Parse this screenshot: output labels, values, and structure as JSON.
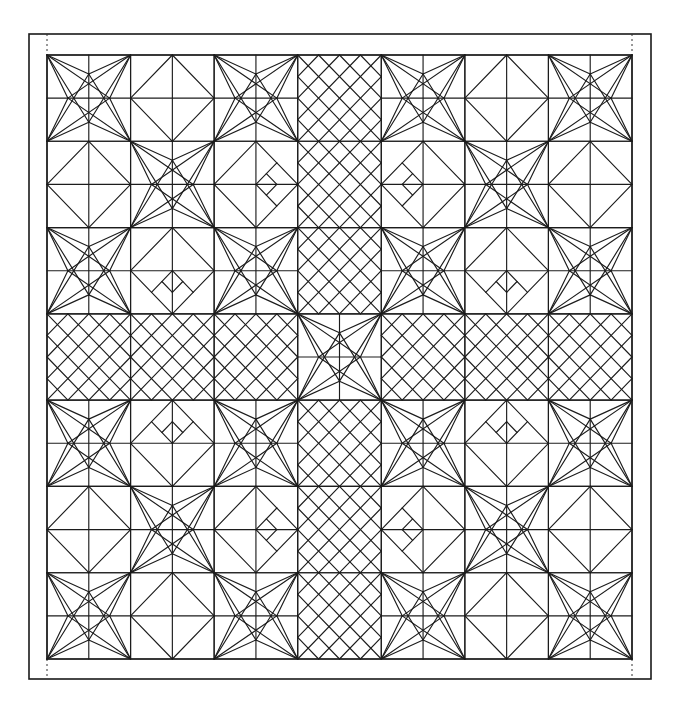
{
  "figure": {
    "title": "",
    "canvas": {
      "width": 681,
      "height": 715
    },
    "frame": {
      "x": 29,
      "y": 34,
      "w": 622,
      "h": 645
    },
    "grid": {
      "x": 47,
      "y": 55,
      "w": 585,
      "h": 604,
      "rows": 7,
      "cols": 7
    },
    "colors": {
      "line": "#1c1c1c",
      "frame": "#1a1a1a",
      "background": "#ffffff"
    },
    "block_types": {
      "A": "star: 2x2 cells with corner-to-third-point diagonals meeting at four inner nodes",
      "C": "lattice: diagonal grid at quarter spacing forming diamonds",
      "D": "diamond: square inscribed through edge midpoints with center cross",
      "B-E": "diamond with inner square in east half",
      "B-W": "diamond with inner square in west half",
      "B-N": "diamond with inner square in north half",
      "B-S": "diamond with inner square in south half"
    },
    "layout": [
      [
        "A",
        "D",
        "A",
        "C",
        "A",
        "D",
        "A"
      ],
      [
        "D",
        "A",
        "B-E",
        "C",
        "B-W",
        "A",
        "D"
      ],
      [
        "A",
        "B-S",
        "A",
        "C",
        "A",
        "B-S",
        "A"
      ],
      [
        "C",
        "C",
        "C",
        "A",
        "C",
        "C",
        "C"
      ],
      [
        "A",
        "B-N",
        "A",
        "C",
        "A",
        "B-N",
        "A"
      ],
      [
        "D",
        "A",
        "B-E",
        "C",
        "B-W",
        "A",
        "D"
      ],
      [
        "A",
        "D",
        "A",
        "C",
        "A",
        "D",
        "A"
      ]
    ]
  }
}
